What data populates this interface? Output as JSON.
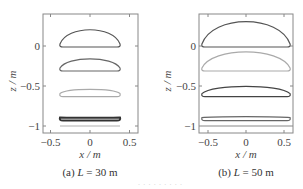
{
  "chart_data": [
    {
      "type": "line",
      "panel": "a",
      "caption": "(a) L = 30 m",
      "caption_parts": {
        "prefix": "(a) ",
        "var": "L",
        "suffix": " = 30 m"
      },
      "xlabel": "x / m",
      "ylabel": "z / m",
      "xlim": [
        -0.6,
        0.6
      ],
      "ylim": [
        -1.1,
        0.4
      ],
      "xticks": [
        -0.5,
        0,
        0.5
      ],
      "xtick_labels": [
        "−0.5",
        "0",
        "0.5"
      ],
      "yticks": [
        0,
        -0.5,
        -1
      ],
      "ytick_labels": [
        "0",
        "−0.5",
        "−1"
      ],
      "grid": false,
      "series": [
        {
          "name": "profile 1",
          "color": "#555555",
          "x_range": [
            -0.38,
            0.38
          ],
          "base_z": 0.0,
          "height": 0.25
        },
        {
          "name": "profile 2",
          "color": "#666666",
          "x_range": [
            -0.38,
            0.38
          ],
          "base_z": -0.3,
          "height": 0.17
        },
        {
          "name": "profile 3",
          "color": "#aaaaaa",
          "x_range": [
            -0.38,
            0.38
          ],
          "base_z": -0.62,
          "height": 0.09
        },
        {
          "name": "profile 4",
          "color": "#333333",
          "x_range": [
            -0.38,
            0.38
          ],
          "base_z": -0.92,
          "height": 0.02
        },
        {
          "name": "profile 5",
          "color": "#b0b0b0",
          "x_range": [
            -0.38,
            0.38
          ],
          "base_z": -1.0,
          "height": 0.0
        }
      ]
    },
    {
      "type": "line",
      "panel": "b",
      "caption": "(b) L = 50 m",
      "caption_parts": {
        "prefix": "(b) ",
        "var": "L",
        "suffix": " = 50 m"
      },
      "xlabel": "x / m",
      "ylabel": "z / m",
      "xlim": [
        -0.6,
        0.6
      ],
      "ylim": [
        -1.1,
        0.4
      ],
      "xticks": [
        -0.5,
        0,
        0.5
      ],
      "xtick_labels": [
        "−0.5",
        "0",
        "0.5"
      ],
      "yticks": [
        0,
        -0.5,
        -1
      ],
      "ytick_labels": [
        "0",
        "−0.5",
        "−1"
      ],
      "grid": false,
      "series": [
        {
          "name": "profile 1",
          "color": "#555555",
          "x_range": [
            -0.58,
            0.58
          ],
          "base_z": 0.0,
          "height": 0.38
        },
        {
          "name": "profile 2",
          "color": "#aaaaaa",
          "x_range": [
            -0.58,
            0.58
          ],
          "base_z": -0.3,
          "height": 0.28
        },
        {
          "name": "profile 3",
          "color": "#444444",
          "x_range": [
            -0.58,
            0.58
          ],
          "base_z": -0.62,
          "height": 0.14
        },
        {
          "name": "profile 4",
          "color": "#666666",
          "x_range": [
            -0.58,
            0.58
          ],
          "base_z": -0.92,
          "height": 0.04
        },
        {
          "name": "profile 5",
          "color": "#888888",
          "x_range": [
            -0.58,
            0.58
          ],
          "base_z": -1.0,
          "height": 0.0
        }
      ]
    }
  ],
  "figure": {
    "faint_bottom_text": "· · · · · · · · ·"
  }
}
